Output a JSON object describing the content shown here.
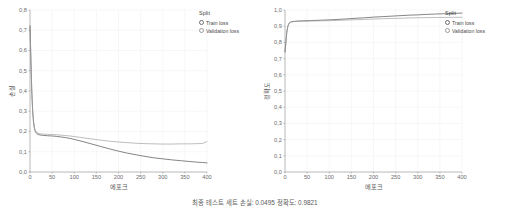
{
  "figure": {
    "caption": "최종 테스트 세트 손실: 0.0495 정확도: 0.9821"
  },
  "panels": [
    {
      "id": "loss-panel",
      "legend": {
        "title": "Split",
        "items": [
          {
            "label": "Train loss",
            "marker": "open-circle-icon",
            "color": "#5a5a5a"
          },
          {
            "label": "Validation loss",
            "marker": "open-circle-icon",
            "color": "#9a9a9a"
          }
        ]
      }
    },
    {
      "id": "accuracy-panel",
      "legend": {
        "title": "Split",
        "items": [
          {
            "label": "Train loss",
            "marker": "open-circle-icon",
            "color": "#5a5a5a"
          },
          {
            "label": "Validation loss",
            "marker": "open-circle-icon",
            "color": "#9a9a9a"
          }
        ]
      }
    }
  ],
  "chart_data": [
    {
      "type": "line",
      "id": "loss-chart",
      "title": "",
      "xlabel": "에포크",
      "ylabel": "손실",
      "xlim": [
        0,
        400
      ],
      "ylim": [
        0.0,
        0.8
      ],
      "xticks": [
        0,
        50,
        100,
        150,
        200,
        250,
        300,
        350,
        400
      ],
      "xticklabels": [
        "0",
        "50",
        "100",
        "150",
        "200",
        "250",
        "300",
        "350",
        "400"
      ],
      "yticks": [
        0.0,
        0.1,
        0.2,
        0.3,
        0.4,
        0.5,
        0.6,
        0.7,
        0.8
      ],
      "yticklabels": [
        "0,0",
        "0,1",
        "0,2",
        "0,3",
        "0,4",
        "0,5",
        "0,6",
        "0,7",
        "0,8"
      ],
      "grid": true,
      "legend_position": "outside-right-top",
      "x": [
        0,
        2,
        4,
        6,
        8,
        10,
        12,
        15,
        20,
        25,
        30,
        40,
        50,
        60,
        70,
        80,
        90,
        100,
        120,
        140,
        160,
        180,
        200,
        220,
        240,
        260,
        280,
        300,
        320,
        340,
        360,
        380,
        390,
        400
      ],
      "series": [
        {
          "name": "Train loss",
          "color": "#5b5b5b",
          "values": [
            0.722,
            0.56,
            0.4,
            0.3,
            0.245,
            0.215,
            0.2,
            0.19,
            0.184,
            0.182,
            0.181,
            0.179,
            0.178,
            0.176,
            0.173,
            0.17,
            0.166,
            0.161,
            0.15,
            0.138,
            0.126,
            0.114,
            0.103,
            0.093,
            0.085,
            0.077,
            0.07,
            0.065,
            0.06,
            0.056,
            0.052,
            0.048,
            0.047,
            0.045
          ]
        },
        {
          "name": "Validation loss",
          "color": "#9b9b9b",
          "values": [
            0.718,
            0.555,
            0.398,
            0.302,
            0.248,
            0.22,
            0.205,
            0.196,
            0.19,
            0.188,
            0.187,
            0.186,
            0.185,
            0.184,
            0.182,
            0.18,
            0.178,
            0.175,
            0.169,
            0.163,
            0.157,
            0.152,
            0.148,
            0.145,
            0.142,
            0.14,
            0.139,
            0.138,
            0.138,
            0.139,
            0.139,
            0.14,
            0.141,
            0.15
          ]
        }
      ]
    },
    {
      "type": "line",
      "id": "accuracy-chart",
      "title": "",
      "xlabel": "에포크",
      "ylabel": "정확도",
      "xlim": [
        0,
        400
      ],
      "ylim": [
        0.0,
        1.0
      ],
      "xticks": [
        0,
        50,
        100,
        150,
        200,
        250,
        300,
        350,
        400
      ],
      "xticklabels": [
        "0",
        "50",
        "100",
        "150",
        "200",
        "250",
        "300",
        "350",
        "400"
      ],
      "yticks": [
        0.0,
        0.1,
        0.2,
        0.3,
        0.4,
        0.5,
        0.6,
        0.7,
        0.8,
        0.9,
        1.0
      ],
      "yticklabels": [
        "0,0",
        "0,1",
        "0,2",
        "0,3",
        "0,4",
        "0,5",
        "0,6",
        "0,7",
        "0,8",
        "0,9",
        "1,0"
      ],
      "grid": true,
      "legend_position": "outside-right-top",
      "x": [
        0,
        2,
        4,
        6,
        8,
        10,
        12,
        15,
        20,
        25,
        30,
        40,
        50,
        60,
        80,
        100,
        120,
        140,
        160,
        180,
        200,
        220,
        240,
        260,
        280,
        300,
        320,
        340,
        360,
        380,
        400
      ],
      "series": [
        {
          "name": "Train loss",
          "color": "#5b5b5b",
          "values": [
            0.742,
            0.8,
            0.862,
            0.895,
            0.912,
            0.921,
            0.925,
            0.928,
            0.93,
            0.931,
            0.932,
            0.933,
            0.934,
            0.935,
            0.937,
            0.939,
            0.942,
            0.945,
            0.949,
            0.952,
            0.956,
            0.959,
            0.962,
            0.965,
            0.968,
            0.97,
            0.973,
            0.975,
            0.977,
            0.979,
            0.981
          ]
        },
        {
          "name": "Validation loss",
          "color": "#9b9b9b",
          "values": [
            0.74,
            0.798,
            0.86,
            0.893,
            0.91,
            0.919,
            0.923,
            0.926,
            0.928,
            0.929,
            0.93,
            0.931,
            0.931,
            0.932,
            0.933,
            0.934,
            0.936,
            0.938,
            0.94,
            0.942,
            0.944,
            0.946,
            0.948,
            0.949,
            0.951,
            0.952,
            0.953,
            0.954,
            0.954,
            0.955,
            0.955
          ]
        }
      ]
    }
  ]
}
